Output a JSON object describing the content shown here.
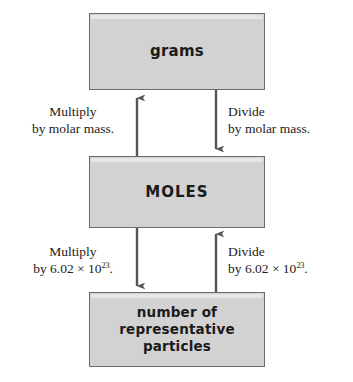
{
  "diagram": {
    "type": "flowchart",
    "boxes": [
      {
        "id": "grams",
        "label": "grams"
      },
      {
        "id": "moles",
        "label": "MOLES"
      },
      {
        "id": "particles",
        "label_line1": "number of",
        "label_line2": "representative",
        "label_line3": "particles"
      }
    ],
    "edges": [
      {
        "id": "grams-to-moles-multiply",
        "from": "moles",
        "to": "grams",
        "direction": "up",
        "caption_line1": "Multiply",
        "caption_line2": "by molar mass.",
        "side": "left"
      },
      {
        "id": "grams-to-moles-divide",
        "from": "grams",
        "to": "moles",
        "direction": "down",
        "caption_line1": "Divide",
        "caption_line2": "by molar mass.",
        "side": "right"
      },
      {
        "id": "moles-to-particles-multiply",
        "from": "moles",
        "to": "particles",
        "direction": "down",
        "caption_line1": "Multiply",
        "caption_line2_prefix": "by 6.02 × 10",
        "caption_line2_exponent": "23",
        "caption_line2_suffix": ".",
        "side": "left"
      },
      {
        "id": "particles-to-moles-divide",
        "from": "particles",
        "to": "moles",
        "direction": "up",
        "caption_line1": "Divide",
        "caption_line2_prefix": "by 6.02 × 10",
        "caption_line2_exponent": "23",
        "caption_line2_suffix": ".",
        "side": "right"
      }
    ],
    "colors": {
      "box_fill": "#d2d2d2",
      "box_border": "#6d6d6d",
      "arrow": "#555555",
      "text": "#1b1b1b",
      "background": "#ffffff"
    }
  }
}
